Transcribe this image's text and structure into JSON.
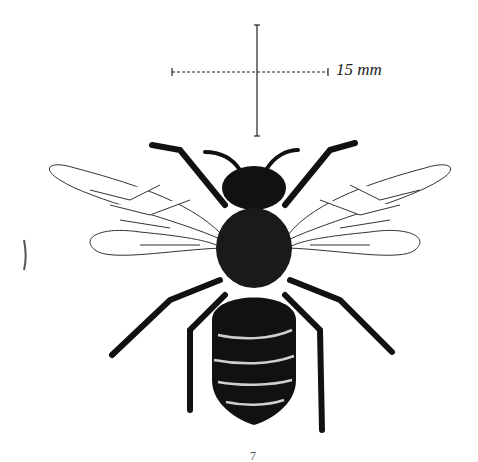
{
  "figure": {
    "scale_bar": {
      "label": "15 mm"
    },
    "plate_number": "7",
    "colors": {
      "ink": "#111111",
      "wing_vein": "#333333",
      "paper": "#ffffff",
      "band": "#cfcfcf"
    }
  }
}
